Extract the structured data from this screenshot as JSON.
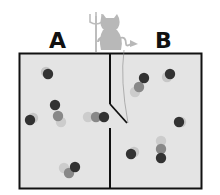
{
  "diagram": {
    "labels": {
      "left": "A",
      "right": "B"
    },
    "colors": {
      "box_fill": "#e4e4e4",
      "wall": "#111111",
      "demon": "#b5b5b5",
      "particle_dark": "#333333"
    },
    "chambers": [
      {
        "name": "A",
        "particle_count": 5
      },
      {
        "name": "B",
        "particle_count": 6
      }
    ],
    "gate": {
      "state": "open"
    }
  }
}
